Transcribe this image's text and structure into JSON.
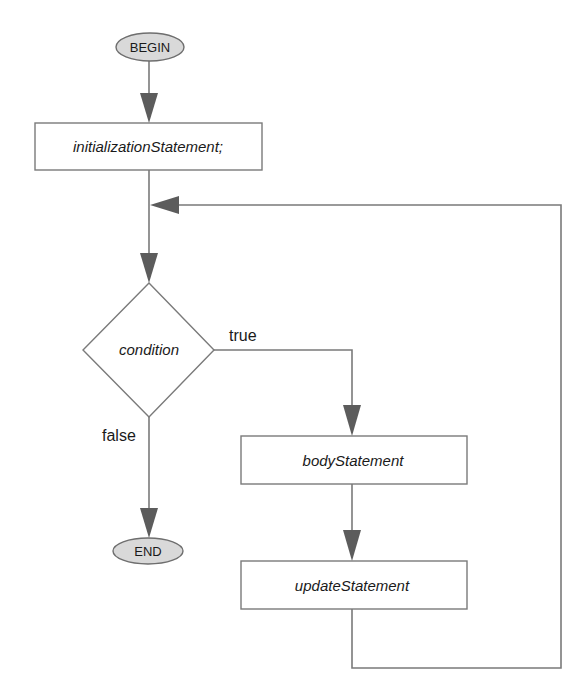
{
  "diagram": {
    "type": "flowchart",
    "title": "",
    "nodes": {
      "begin": {
        "label": "BEGIN",
        "shape": "ellipse"
      },
      "init": {
        "label": "initializationStatement;",
        "shape": "rectangle"
      },
      "condition": {
        "label": "condition",
        "shape": "diamond"
      },
      "body": {
        "label": "bodyStatement",
        "shape": "rectangle"
      },
      "update": {
        "label": "updateStatement",
        "shape": "rectangle"
      },
      "end": {
        "label": "END",
        "shape": "ellipse"
      }
    },
    "edges": {
      "true_label": "true",
      "false_label": "false"
    },
    "colors": {
      "line": "#7a7a7a",
      "arrowhead": "#5c5c5c",
      "terminal_fill": "#d9d9d9",
      "text": "#1a1a1a"
    }
  }
}
